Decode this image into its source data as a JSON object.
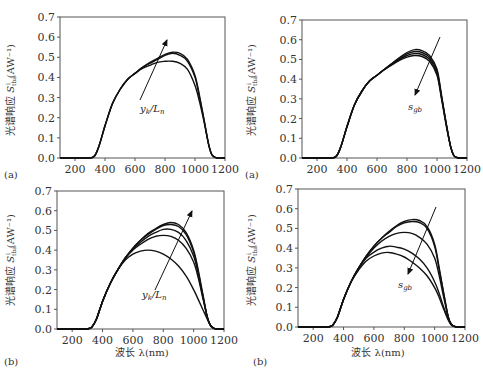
{
  "chart_data": [
    {
      "id": "tl",
      "panel_label": "(a)",
      "type": "line",
      "title": "",
      "xlabel": "",
      "ylabel": "光谱响应 S^i_tba (AW^-1)",
      "xlim": [
        100,
        1200
      ],
      "ylim": [
        0.0,
        0.7
      ],
      "xticks": [
        200,
        400,
        600,
        800,
        1000,
        1200
      ],
      "yticks": [
        "0.0",
        "0.1",
        "0.2",
        "0.3",
        "0.4",
        "0.5",
        "0.6",
        "0.7"
      ],
      "annotation": "yk/Ln",
      "arrow_direction": "up",
      "x": [
        300,
        330,
        360,
        400,
        450,
        500,
        550,
        600,
        650,
        700,
        750,
        800,
        850,
        900,
        950,
        1000,
        1030,
        1060,
        1090,
        1110,
        1130,
        1150,
        1200
      ],
      "series": [
        {
          "name": "curve1",
          "values": [
            0.0,
            0.01,
            0.06,
            0.16,
            0.27,
            0.34,
            0.39,
            0.42,
            0.445,
            0.46,
            0.475,
            0.48,
            0.48,
            0.47,
            0.44,
            0.36,
            0.28,
            0.18,
            0.07,
            0.02,
            0.005,
            0.0,
            0.0
          ]
        },
        {
          "name": "curve2",
          "values": [
            0.0,
            0.01,
            0.06,
            0.16,
            0.27,
            0.34,
            0.39,
            0.42,
            0.45,
            0.47,
            0.49,
            0.51,
            0.52,
            0.51,
            0.48,
            0.4,
            0.3,
            0.19,
            0.07,
            0.02,
            0.005,
            0.0,
            0.0
          ]
        },
        {
          "name": "curve3",
          "values": [
            0.0,
            0.01,
            0.06,
            0.16,
            0.27,
            0.34,
            0.39,
            0.42,
            0.45,
            0.475,
            0.495,
            0.515,
            0.525,
            0.52,
            0.49,
            0.41,
            0.31,
            0.19,
            0.07,
            0.02,
            0.005,
            0.0,
            0.0
          ]
        }
      ]
    },
    {
      "id": "tr",
      "panel_label": "(a)",
      "type": "line",
      "title": "",
      "xlabel": "",
      "ylabel": "光谱响应 S^i_tba (AW^-1)",
      "xlim": [
        100,
        1200
      ],
      "ylim": [
        0.0,
        0.7
      ],
      "xticks": [
        200,
        400,
        600,
        800,
        1000,
        1200
      ],
      "yticks": [
        "0.0",
        "0.1",
        "0.2",
        "0.3",
        "0.4",
        "0.5",
        "0.6",
        "0.7"
      ],
      "annotation": "sgb",
      "arrow_direction": "down",
      "x": [
        300,
        330,
        360,
        400,
        450,
        500,
        550,
        600,
        650,
        700,
        750,
        800,
        850,
        900,
        950,
        1000,
        1030,
        1060,
        1090,
        1110,
        1130,
        1150,
        1200
      ],
      "series": [
        {
          "name": "curve1",
          "values": [
            0.0,
            0.01,
            0.06,
            0.16,
            0.27,
            0.34,
            0.39,
            0.42,
            0.45,
            0.48,
            0.51,
            0.535,
            0.55,
            0.545,
            0.52,
            0.45,
            0.32,
            0.18,
            0.06,
            0.015,
            0.003,
            0.0,
            0.0
          ]
        },
        {
          "name": "curve2",
          "values": [
            0.0,
            0.01,
            0.06,
            0.16,
            0.27,
            0.34,
            0.39,
            0.42,
            0.45,
            0.478,
            0.505,
            0.528,
            0.54,
            0.535,
            0.51,
            0.44,
            0.31,
            0.18,
            0.06,
            0.015,
            0.003,
            0.0,
            0.0
          ]
        },
        {
          "name": "curve3",
          "values": [
            0.0,
            0.01,
            0.06,
            0.16,
            0.27,
            0.34,
            0.39,
            0.42,
            0.45,
            0.476,
            0.5,
            0.52,
            0.53,
            0.525,
            0.5,
            0.43,
            0.31,
            0.18,
            0.06,
            0.015,
            0.003,
            0.0,
            0.0
          ]
        },
        {
          "name": "curve4",
          "values": [
            0.0,
            0.01,
            0.06,
            0.16,
            0.27,
            0.34,
            0.39,
            0.42,
            0.448,
            0.473,
            0.495,
            0.512,
            0.52,
            0.515,
            0.49,
            0.42,
            0.3,
            0.17,
            0.06,
            0.015,
            0.003,
            0.0,
            0.0
          ]
        }
      ]
    },
    {
      "id": "bl",
      "panel_label": "(b)",
      "type": "line",
      "title": "",
      "xlabel": "波长 λ(nm)",
      "ylabel": "光谱响应 S^i_tba (AW^-1)",
      "xlim": [
        100,
        1200
      ],
      "ylim": [
        0.0,
        0.7
      ],
      "xticks": [
        200,
        400,
        600,
        800,
        1000,
        1200
      ],
      "yticks": [
        "0.0",
        "0.1",
        "0.2",
        "0.3",
        "0.4",
        "0.5",
        "0.6",
        "0.7"
      ],
      "annotation": "yk/Ln",
      "arrow_direction": "up",
      "x": [
        300,
        330,
        360,
        400,
        450,
        500,
        550,
        600,
        650,
        700,
        750,
        800,
        850,
        900,
        950,
        1000,
        1030,
        1060,
        1090,
        1110,
        1130,
        1150,
        1200
      ],
      "series": [
        {
          "name": "curve1",
          "values": [
            0.0,
            0.01,
            0.05,
            0.14,
            0.23,
            0.3,
            0.35,
            0.38,
            0.395,
            0.4,
            0.395,
            0.38,
            0.355,
            0.32,
            0.27,
            0.2,
            0.15,
            0.1,
            0.05,
            0.02,
            0.005,
            0.0,
            0.0
          ]
        },
        {
          "name": "curve2",
          "values": [
            0.0,
            0.01,
            0.05,
            0.14,
            0.23,
            0.3,
            0.36,
            0.4,
            0.43,
            0.455,
            0.47,
            0.475,
            0.47,
            0.45,
            0.41,
            0.34,
            0.26,
            0.16,
            0.06,
            0.02,
            0.005,
            0.0,
            0.0
          ]
        },
        {
          "name": "curve3",
          "values": [
            0.0,
            0.01,
            0.05,
            0.14,
            0.23,
            0.3,
            0.36,
            0.405,
            0.44,
            0.47,
            0.49,
            0.505,
            0.505,
            0.49,
            0.45,
            0.37,
            0.28,
            0.17,
            0.06,
            0.02,
            0.005,
            0.0,
            0.0
          ]
        },
        {
          "name": "curve4",
          "values": [
            0.0,
            0.01,
            0.05,
            0.14,
            0.23,
            0.3,
            0.36,
            0.41,
            0.45,
            0.48,
            0.505,
            0.525,
            0.53,
            0.52,
            0.48,
            0.39,
            0.29,
            0.17,
            0.06,
            0.02,
            0.005,
            0.0,
            0.0
          ]
        },
        {
          "name": "curve5",
          "values": [
            0.0,
            0.01,
            0.05,
            0.14,
            0.23,
            0.3,
            0.36,
            0.41,
            0.45,
            0.485,
            0.51,
            0.53,
            0.54,
            0.53,
            0.49,
            0.4,
            0.3,
            0.18,
            0.06,
            0.02,
            0.005,
            0.0,
            0.0
          ]
        }
      ]
    },
    {
      "id": "br",
      "panel_label": "(b)",
      "type": "line",
      "title": "",
      "xlabel": "波长 λ(nm)",
      "ylabel": "光谱响应 S^i_tba (AW^-1)",
      "xlim": [
        100,
        1200
      ],
      "ylim": [
        0.0,
        0.7
      ],
      "xticks": [
        200,
        400,
        600,
        800,
        1000,
        1200
      ],
      "yticks": [
        "0.0",
        "0.1",
        "0.2",
        "0.3",
        "0.4",
        "0.5",
        "0.6",
        "0.7"
      ],
      "annotation": "sgb",
      "arrow_direction": "down",
      "x": [
        300,
        330,
        360,
        400,
        450,
        500,
        550,
        600,
        650,
        700,
        750,
        800,
        850,
        900,
        950,
        1000,
        1030,
        1060,
        1090,
        1110,
        1130,
        1150,
        1200
      ],
      "series": [
        {
          "name": "curve1",
          "values": [
            0.0,
            0.01,
            0.05,
            0.14,
            0.23,
            0.3,
            0.36,
            0.41,
            0.45,
            0.485,
            0.515,
            0.535,
            0.545,
            0.54,
            0.51,
            0.42,
            0.3,
            0.17,
            0.05,
            0.015,
            0.003,
            0.0,
            0.0
          ]
        },
        {
          "name": "curve2",
          "values": [
            0.0,
            0.01,
            0.05,
            0.14,
            0.23,
            0.3,
            0.36,
            0.41,
            0.45,
            0.48,
            0.51,
            0.528,
            0.535,
            0.53,
            0.5,
            0.41,
            0.29,
            0.17,
            0.05,
            0.015,
            0.003,
            0.0,
            0.0
          ]
        },
        {
          "name": "curve3",
          "values": [
            0.0,
            0.01,
            0.05,
            0.14,
            0.23,
            0.3,
            0.355,
            0.4,
            0.435,
            0.46,
            0.475,
            0.48,
            0.475,
            0.455,
            0.42,
            0.35,
            0.26,
            0.15,
            0.05,
            0.015,
            0.003,
            0.0,
            0.0
          ]
        },
        {
          "name": "curve4",
          "values": [
            0.0,
            0.01,
            0.05,
            0.14,
            0.23,
            0.3,
            0.35,
            0.38,
            0.4,
            0.41,
            0.405,
            0.395,
            0.375,
            0.345,
            0.3,
            0.23,
            0.17,
            0.1,
            0.04,
            0.012,
            0.003,
            0.0,
            0.0
          ]
        },
        {
          "name": "curve5",
          "values": [
            0.0,
            0.01,
            0.05,
            0.14,
            0.23,
            0.29,
            0.335,
            0.36,
            0.375,
            0.378,
            0.37,
            0.355,
            0.33,
            0.3,
            0.26,
            0.2,
            0.15,
            0.09,
            0.035,
            0.01,
            0.003,
            0.0,
            0.0
          ]
        }
      ]
    }
  ],
  "layout": [
    {
      "id": "tl",
      "x0": 60,
      "x1": 225,
      "y0": 158,
      "y1": 17,
      "arrow": [
        [
          140,
          100
        ],
        [
          167,
          40
        ]
      ],
      "ann_xy": [
        140,
        112
      ],
      "label_xy": [
        4,
        178
      ],
      "xlabel_xy": null,
      "ylabel_xy": [
        14,
        90
      ]
    },
    {
      "id": "tr",
      "x0": 302,
      "x1": 467,
      "y0": 158,
      "y1": 20,
      "arrow": [
        [
          440,
          37
        ],
        [
          415,
          95
        ]
      ],
      "ann_xy": [
        408,
        110
      ],
      "label_xy": [
        245,
        178
      ],
      "xlabel_xy": null,
      "ylabel_xy": [
        255,
        90
      ]
    },
    {
      "id": "bl",
      "x0": 57,
      "x1": 224,
      "y0": 329,
      "y1": 191,
      "arrow": [
        [
          155,
          290
        ],
        [
          192,
          211
        ]
      ],
      "ann_xy": [
        142,
        298
      ],
      "label_xy": [
        4,
        365
      ],
      "xlabel_xy": [
        142,
        356
      ],
      "ylabel_xy": [
        14,
        260
      ]
    },
    {
      "id": "br",
      "x0": 298,
      "x1": 465,
      "y0": 327,
      "y1": 189,
      "arrow": [
        [
          436,
          207
        ],
        [
          408,
          274
        ]
      ],
      "ann_xy": [
        398,
        288
      ],
      "label_xy": [
        253,
        365
      ],
      "xlabel_xy": [
        378,
        356
      ],
      "ylabel_xy": [
        255,
        260
      ]
    }
  ],
  "labels": {
    "ylabel_main": "光谱响应 ",
    "ylabel_sym": "S",
    "ylabel_unit": "(AW⁻¹)",
    "xlabel": "波长 λ(nm)"
  }
}
